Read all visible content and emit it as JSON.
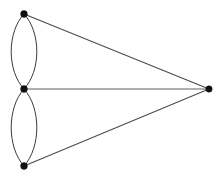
{
  "figure": {
    "name": "multigraph-diagram",
    "width": 221,
    "height": 179,
    "background_color": "#ffffff"
  },
  "style": {
    "vertex_color": "#111111",
    "edge_color": "#3a3a3a",
    "straight_edge_color": "#4a4a4a",
    "horizontal_edge_color": "#5a5a5a",
    "vertex_radius": 3.4,
    "edge_width": 1
  },
  "graph_data": {
    "type": "multigraph",
    "directed": false,
    "vertex_count": 4,
    "edge_count": 7,
    "vertices": [
      {
        "id": "v-top",
        "label": "",
        "x": 24,
        "y": 14,
        "degree": 3
      },
      {
        "id": "v-middle",
        "label": "",
        "x": 24,
        "y": 89,
        "degree": 5
      },
      {
        "id": "v-bottom",
        "label": "",
        "x": 24,
        "y": 166,
        "degree": 3
      },
      {
        "id": "v-right",
        "label": "",
        "x": 209,
        "y": 89,
        "degree": 3
      }
    ],
    "edges": [
      {
        "id": "e-top-middle-left",
        "source": "v-top",
        "target": "v-middle",
        "shape": "curve",
        "bulge": "left",
        "extreme_x": 11
      },
      {
        "id": "e-top-middle-right",
        "source": "v-top",
        "target": "v-middle",
        "shape": "curve",
        "bulge": "right",
        "extreme_x": 37
      },
      {
        "id": "e-middle-bottom-left",
        "source": "v-middle",
        "target": "v-bottom",
        "shape": "curve",
        "bulge": "left",
        "extreme_x": 11
      },
      {
        "id": "e-middle-bottom-right",
        "source": "v-middle",
        "target": "v-bottom",
        "shape": "curve",
        "bulge": "right",
        "extreme_x": 37
      },
      {
        "id": "e-top-right",
        "source": "v-top",
        "target": "v-right",
        "shape": "line",
        "bulge": "none",
        "extreme_x": null
      },
      {
        "id": "e-middle-right",
        "source": "v-middle",
        "target": "v-right",
        "shape": "line",
        "bulge": "none",
        "extreme_x": null
      },
      {
        "id": "e-bottom-right",
        "source": "v-bottom",
        "target": "v-right",
        "shape": "line",
        "bulge": "none",
        "extreme_x": null
      }
    ]
  }
}
